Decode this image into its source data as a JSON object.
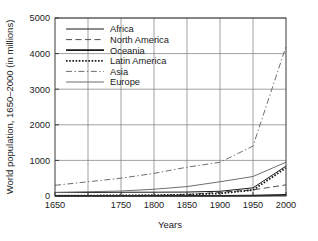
{
  "chart_data": {
    "type": "line",
    "title": "",
    "xlabel": "Years",
    "ylabel": "World population, 1650–2000 (in millions)",
    "xlim": [
      1650,
      2000
    ],
    "ylim": [
      0,
      5000
    ],
    "xticks": [
      1650,
      1700,
      1750,
      1800,
      1850,
      1900,
      1950,
      2000
    ],
    "xtick_labels": [
      "1650",
      "1750",
      "1800",
      "1850",
      "1900",
      "1950",
      "2000"
    ],
    "xtick_labeled": [
      1650,
      1750,
      1800,
      1850,
      1900,
      1950,
      2000
    ],
    "yticks": [
      0,
      1000,
      2000,
      3000,
      4000,
      5000
    ],
    "ytick_labels": [
      "0",
      "1000",
      "2000",
      "3000",
      "4000",
      "5000"
    ],
    "grid": true,
    "legend_position": "upper-left-inside",
    "x": [
      1650,
      1700,
      1750,
      1800,
      1850,
      1900,
      1950,
      2000
    ],
    "series": [
      {
        "name": "Africa",
        "style": "solid",
        "color": "#1a1a1a",
        "width": 1.0,
        "values": [
          100,
          100,
          105,
          107,
          111,
          133,
          229,
          840
        ]
      },
      {
        "name": "North America",
        "style": "dashed",
        "color": "#4d4d4d",
        "width": 1.0,
        "values": [
          5,
          5,
          6,
          16,
          39,
          106,
          172,
          312
        ]
      },
      {
        "name": "Oceania",
        "style": "solid",
        "color": "#1a1a1a",
        "width": 1.8,
        "values": [
          2,
          2,
          2,
          2,
          2,
          6,
          13,
          31
        ]
      },
      {
        "name": "Latin America",
        "style": "dotted",
        "color": "#1a1a1a",
        "width": 1.8,
        "values": [
          12,
          12,
          16,
          24,
          38,
          74,
          167,
          790
        ]
      },
      {
        "name": "Asia",
        "style": "dash-dot",
        "color": "#6e6e6e",
        "width": 1.0,
        "values": [
          300,
          400,
          500,
          635,
          809,
          947,
          1402,
          4200
        ]
      },
      {
        "name": "Europe",
        "style": "solid",
        "color": "#6e6e6e",
        "width": 1.0,
        "values": [
          100,
          120,
          140,
          190,
          265,
          400,
          547,
          950
        ]
      }
    ]
  },
  "legend": {
    "items": [
      {
        "label": "Africa"
      },
      {
        "label": "North America"
      },
      {
        "label": "Oceania"
      },
      {
        "label": "Latin America"
      },
      {
        "label": "Asia"
      },
      {
        "label": "Europe"
      }
    ]
  }
}
